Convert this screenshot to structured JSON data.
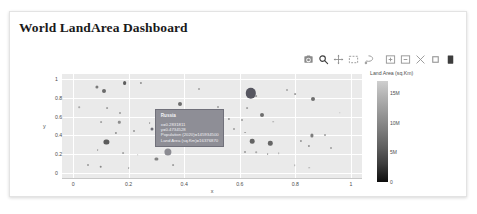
{
  "page": {
    "title": "World LandArea Dashboard",
    "background": "#ffffff",
    "card_background": "#ffffff"
  },
  "modebar": {
    "buttons": [
      {
        "name": "camera-icon",
        "label": "Download plot as a png"
      },
      {
        "name": "zoom-icon",
        "label": "Zoom"
      },
      {
        "name": "pan-icon",
        "label": "Pan"
      },
      {
        "name": "box-select-icon",
        "label": "Box Select"
      },
      {
        "name": "lasso-select-icon",
        "label": "Lasso Select"
      },
      {
        "name": "zoom-in-icon",
        "label": "Zoom in"
      },
      {
        "name": "zoom-out-icon",
        "label": "Zoom out"
      },
      {
        "name": "autoscale-icon",
        "label": "Autoscale"
      },
      {
        "name": "reset-axes-icon",
        "label": "Reset axes"
      },
      {
        "name": "plotly-logo-icon",
        "label": "Produced with Plotly"
      }
    ]
  },
  "tooltip": {
    "title": "Russia",
    "rows": [
      "x=0.2831811",
      "y=0.4734528",
      "Population (2020)=145934500",
      "Land Area (sq.Km)=16376870"
    ],
    "background": "#8e8e96",
    "point": {
      "x": 0.2831811,
      "y": 0.4734528
    }
  },
  "colorbar": {
    "title": "Land Area (sq.Km)",
    "ticks": [
      "15M",
      "10M",
      "5M",
      "0"
    ],
    "tick_values": [
      15000000,
      10000000,
      5000000,
      0
    ],
    "min_color": "#0d0d0d",
    "max_color": "#cfcfcf"
  },
  "chart_data": {
    "type": "scatter",
    "title": "",
    "xlabel": "x",
    "ylabel": "y",
    "xlim": [
      -0.04,
      1.04
    ],
    "ylim": [
      -0.05,
      1.05
    ],
    "xticks": [
      "0",
      "0.2",
      "0.4",
      "0.6",
      "0.8",
      "1"
    ],
    "xtick_values": [
      0,
      0.2,
      0.4,
      0.6,
      0.8,
      1
    ],
    "yticks": [
      "1",
      "0.8",
      "0.6",
      "0.4",
      "0.2",
      "0"
    ],
    "ytick_values": [
      1,
      0.8,
      0.6,
      0.4,
      0.2,
      0
    ],
    "grid": true,
    "grid_color": "#ffffff",
    "plot_bg": "#eaeaea",
    "legend": "none",
    "size_encoding": "Population (2020)",
    "color_encoding": "Land Area (sq.Km)",
    "points": [
      {
        "x": 0.085,
        "y": 0.915,
        "r": 1.6,
        "c": "#7a7a7a"
      },
      {
        "x": 0.185,
        "y": 0.955,
        "r": 1.9,
        "c": "#5e5e5e"
      },
      {
        "x": 0.243,
        "y": 0.96,
        "r": 1.1,
        "c": "#8f8f8f"
      },
      {
        "x": 0.11,
        "y": 0.868,
        "r": 2.0,
        "c": "#6a6a6a"
      },
      {
        "x": 0.452,
        "y": 0.892,
        "r": 1.0,
        "c": "#a0a0a0"
      },
      {
        "x": 0.64,
        "y": 0.845,
        "r": 5.2,
        "c": "#565660"
      },
      {
        "x": 0.66,
        "y": 0.815,
        "r": 0.9,
        "c": "#9b9b9b"
      },
      {
        "x": 0.77,
        "y": 0.878,
        "r": 1.0,
        "c": "#a3a3a3"
      },
      {
        "x": 0.8,
        "y": 0.84,
        "r": 0.9,
        "c": "#9f9f9f"
      },
      {
        "x": 0.865,
        "y": 0.79,
        "r": 2.0,
        "c": "#6f6f6f"
      },
      {
        "x": 0.022,
        "y": 0.7,
        "r": 0.8,
        "c": "#a8a8a8"
      },
      {
        "x": 0.122,
        "y": 0.69,
        "r": 0.9,
        "c": "#a2a2a2"
      },
      {
        "x": 0.168,
        "y": 0.64,
        "r": 1.0,
        "c": "#9a9a9a"
      },
      {
        "x": 0.383,
        "y": 0.735,
        "r": 2.0,
        "c": "#6d6d6d"
      },
      {
        "x": 0.523,
        "y": 0.7,
        "r": 1.0,
        "c": "#9e9e9e"
      },
      {
        "x": 0.625,
        "y": 0.69,
        "r": 0.9,
        "c": "#a4a4a4"
      },
      {
        "x": 0.1,
        "y": 0.545,
        "r": 0.9,
        "c": "#a5a5a5"
      },
      {
        "x": 0.166,
        "y": 0.54,
        "r": 1.2,
        "c": "#8d8d8d"
      },
      {
        "x": 0.275,
        "y": 0.528,
        "r": 0.9,
        "c": "#a0a0a0"
      },
      {
        "x": 0.56,
        "y": 0.575,
        "r": 1.1,
        "c": "#949494"
      },
      {
        "x": 0.608,
        "y": 0.56,
        "r": 1.0,
        "c": "#9b9b9b"
      },
      {
        "x": 0.68,
        "y": 0.62,
        "r": 2.0,
        "c": "#6e6e6e"
      },
      {
        "x": 0.72,
        "y": 0.545,
        "r": 0.8,
        "c": "#aaaaaa"
      },
      {
        "x": 0.58,
        "y": 0.47,
        "r": 1.0,
        "c": "#9d9d9d"
      },
      {
        "x": 0.62,
        "y": 0.43,
        "r": 0.9,
        "c": "#a2a2a2"
      },
      {
        "x": 0.155,
        "y": 0.43,
        "r": 1.1,
        "c": "#8f8f8f"
      },
      {
        "x": 0.22,
        "y": 0.445,
        "r": 1.0,
        "c": "#979797"
      },
      {
        "x": 0.12,
        "y": 0.33,
        "r": 2.6,
        "c": "#5c5c5c"
      },
      {
        "x": 0.86,
        "y": 0.4,
        "r": 1.6,
        "c": "#7d7d7d"
      },
      {
        "x": 0.905,
        "y": 0.405,
        "r": 1.0,
        "c": "#9c9c9c"
      },
      {
        "x": 0.645,
        "y": 0.34,
        "r": 2.3,
        "c": "#636363"
      },
      {
        "x": 0.71,
        "y": 0.315,
        "r": 2.2,
        "c": "#666666"
      },
      {
        "x": 0.82,
        "y": 0.345,
        "r": 1.1,
        "c": "#949494"
      },
      {
        "x": 0.85,
        "y": 0.29,
        "r": 1.1,
        "c": "#909090"
      },
      {
        "x": 0.928,
        "y": 0.27,
        "r": 1.0,
        "c": "#9e9e9e"
      },
      {
        "x": 0.088,
        "y": 0.245,
        "r": 0.9,
        "c": "#a3a3a3"
      },
      {
        "x": 0.18,
        "y": 0.215,
        "r": 0.9,
        "c": "#a6a6a6"
      },
      {
        "x": 0.232,
        "y": 0.195,
        "r": 0.8,
        "c": "#ababab"
      },
      {
        "x": 0.34,
        "y": 0.225,
        "r": 3.6,
        "c": "#8b8b92"
      },
      {
        "x": 0.3,
        "y": 0.155,
        "r": 1.6,
        "c": "#828282"
      },
      {
        "x": 0.62,
        "y": 0.225,
        "r": 1.0,
        "c": "#999999"
      },
      {
        "x": 0.66,
        "y": 0.225,
        "r": 0.8,
        "c": "#a9a9a9"
      },
      {
        "x": 0.7,
        "y": 0.2,
        "r": 0.9,
        "c": "#a1a1a1"
      },
      {
        "x": 0.74,
        "y": 0.215,
        "r": 0.8,
        "c": "#acacac"
      },
      {
        "x": 0.052,
        "y": 0.09,
        "r": 1.0,
        "c": "#9a9a9a"
      },
      {
        "x": 0.1,
        "y": 0.07,
        "r": 1.3,
        "c": "#8a8a8a"
      },
      {
        "x": 0.2,
        "y": 0.055,
        "r": 0.9,
        "c": "#a4a4a4"
      },
      {
        "x": 0.36,
        "y": 0.085,
        "r": 0.9,
        "c": "#a0a0a0"
      },
      {
        "x": 0.798,
        "y": 0.085,
        "r": 0.8,
        "c": "#adadad"
      },
      {
        "x": 0.85,
        "y": 0.06,
        "r": 0.8,
        "c": "#aeaeae"
      },
      {
        "x": 0.47,
        "y": 0.46,
        "r": 0.7,
        "c": "#b0b0b0"
      },
      {
        "x": 0.96,
        "y": 0.64,
        "r": 0.7,
        "c": "#b2b2b2"
      }
    ]
  }
}
